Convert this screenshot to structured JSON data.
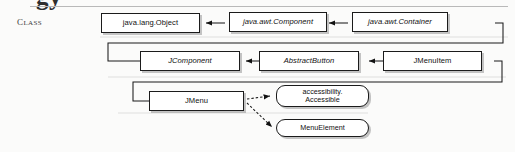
{
  "page": {
    "clipped_heading_text": "gy",
    "section_label": "Class"
  },
  "diagram": {
    "type": "uml-class-hierarchy",
    "colors": {
      "background": "#fbfbfa",
      "box_fill": "#ffffff",
      "box_border": "#1b1b1b",
      "shadow": "#969696",
      "rule": "#b9b9b9",
      "text": "#101010"
    },
    "rows": [
      {
        "row": 1,
        "nodes": [
          {
            "id": "java-lang-object",
            "label": "java.lang.Object",
            "style": "concrete",
            "shape": "rect"
          },
          {
            "id": "java-awt-component",
            "label": "java.awt.Component",
            "style": "abstract",
            "shape": "rect"
          },
          {
            "id": "java-awt-container",
            "label": "java.awt.Container",
            "style": "abstract",
            "shape": "rect"
          }
        ]
      },
      {
        "row": 2,
        "nodes": [
          {
            "id": "jcomponent",
            "label": "JComponent",
            "style": "abstract",
            "shape": "rect"
          },
          {
            "id": "abstractbutton",
            "label": "AbstractButton",
            "style": "abstract",
            "shape": "rect"
          },
          {
            "id": "jmenuitem",
            "label": "JMenuItem",
            "style": "concrete",
            "shape": "rect"
          }
        ]
      },
      {
        "row": 3,
        "nodes": [
          {
            "id": "jmenu",
            "label": "JMenu",
            "style": "concrete",
            "shape": "rect"
          }
        ]
      }
    ],
    "interfaces": [
      {
        "id": "accessible",
        "line1": "accessibility.",
        "line2": "Accessible",
        "shape": "rounded-rect"
      },
      {
        "id": "menuelement",
        "line1": "MenuElement",
        "line2": "",
        "shape": "rounded-rect"
      }
    ],
    "edges": [
      {
        "from": "java-awt-component",
        "to": "java-lang-object",
        "kind": "extends",
        "arrow": "solid-filled"
      },
      {
        "from": "java-awt-container",
        "to": "java-awt-component",
        "kind": "extends",
        "arrow": "solid-filled"
      },
      {
        "from": "jcomponent",
        "to": "java-awt-container",
        "kind": "extends",
        "arrow": "solid-filled"
      },
      {
        "from": "abstractbutton",
        "to": "jcomponent",
        "kind": "extends",
        "arrow": "solid-filled"
      },
      {
        "from": "jmenuitem",
        "to": "abstractbutton",
        "kind": "extends",
        "arrow": "solid-filled"
      },
      {
        "from": "jmenu",
        "to": "jmenuitem",
        "kind": "extends",
        "arrow": "solid-filled"
      },
      {
        "from": "jmenu",
        "to": "accessible",
        "kind": "implements",
        "arrow": "dashed-filled"
      },
      {
        "from": "jmenu",
        "to": "menuelement",
        "kind": "implements",
        "arrow": "dashed-filled"
      }
    ]
  }
}
